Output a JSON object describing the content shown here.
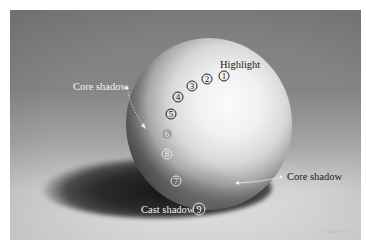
{
  "figure": {
    "colors": {
      "background_dark": "#7e7e7e",
      "background_light": "#dedede",
      "sphere_highlight": "#fbfbfb",
      "core_shadow": "#1e1e1e",
      "cast_shadow": "#161616",
      "label_light": "#f4f4f4",
      "label_dark": "#1a1a1a"
    },
    "labels": {
      "highlight": "Highlight",
      "core_shadow_left": "Core shadow",
      "core_shadow_right": "Core shadow",
      "cast_shadow": "Cast shadow"
    },
    "value_markers": [
      {
        "id": "1",
        "label": "1"
      },
      {
        "id": "2",
        "label": "2"
      },
      {
        "id": "3",
        "label": "3"
      },
      {
        "id": "4",
        "label": "4"
      },
      {
        "id": "5",
        "label": "5"
      },
      {
        "id": "6",
        "label": "6"
      },
      {
        "id": "8",
        "label": "8"
      },
      {
        "id": "7",
        "label": "7"
      },
      {
        "id": "9",
        "label": "9"
      }
    ],
    "watermark": "LNZBHP307"
  }
}
